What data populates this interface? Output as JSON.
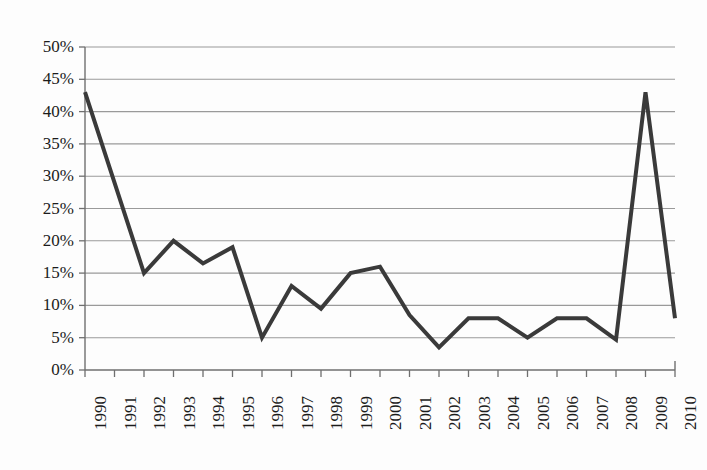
{
  "chart_data": {
    "type": "line",
    "title": "",
    "subtitle": "",
    "xlabel": "",
    "ylabel": "",
    "categories": [
      "1990",
      "1991",
      "1992",
      "1993",
      "1994",
      "1995",
      "1996",
      "1997",
      "1998",
      "1999",
      "2000",
      "2001",
      "2002",
      "2003",
      "2004",
      "2005",
      "2006",
      "2007",
      "2008",
      "2009",
      "2010"
    ],
    "values": [
      43,
      29,
      15,
      20,
      16.5,
      19,
      5,
      13,
      9.5,
      15,
      16,
      8.5,
      3.5,
      8,
      8,
      5,
      8,
      8,
      4.7,
      43,
      8
    ],
    "ylim": [
      0,
      50
    ],
    "ytick_values": [
      0,
      5,
      10,
      15,
      20,
      25,
      30,
      35,
      40,
      45,
      50
    ],
    "ytick_labels": [
      "0%",
      "5%",
      "10%",
      "15%",
      "20%",
      "25%",
      "30%",
      "35%",
      "40%",
      "45%",
      "50%"
    ],
    "grid": true,
    "grid_axis": "y",
    "legend": false,
    "legend_position": "none",
    "series": [
      {
        "name": "",
        "values": [
          43,
          29,
          15,
          20,
          16.5,
          19,
          5,
          13,
          9.5,
          15,
          16,
          8.5,
          3.5,
          8,
          8,
          5,
          8,
          8,
          4.7,
          43,
          8
        ]
      }
    ],
    "annotations": []
  },
  "style": {
    "line_color": "#3a3a3a",
    "grid_color": "#9a9a9a",
    "axis_color": "#6f6f6f",
    "text_color": "#1b1b1b",
    "background": "#fdfdfd",
    "line_width": 4
  },
  "axes": {
    "x_tick_rotation": "-90",
    "y_axis_unit": "percent"
  }
}
